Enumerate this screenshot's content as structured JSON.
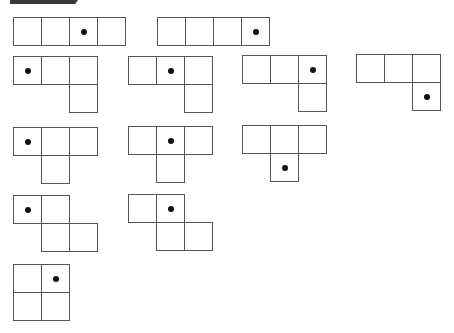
{
  "header": {
    "banner_color": "#3a3a3a"
  },
  "colors": {
    "grid_line": "#555555",
    "dot": "#111111",
    "background": "#ffffff"
  },
  "cell_size": 29,
  "shapes": [
    {
      "id": "I-dot-3",
      "x": 13,
      "y": 17,
      "cells": [
        [
          0,
          0
        ],
        [
          1,
          0
        ],
        [
          2,
          0
        ],
        [
          3,
          0
        ]
      ],
      "dot": [
        2,
        0
      ]
    },
    {
      "id": "I-dot-4",
      "x": 157,
      "y": 17,
      "cells": [
        [
          0,
          0
        ],
        [
          1,
          0
        ],
        [
          2,
          0
        ],
        [
          3,
          0
        ]
      ],
      "dot": [
        3,
        0
      ]
    },
    {
      "id": "L-dot-1",
      "x": 13,
      "y": 56,
      "cells": [
        [
          0,
          0
        ],
        [
          1,
          0
        ],
        [
          2,
          0
        ],
        [
          2,
          1
        ]
      ],
      "dot": [
        0,
        0
      ]
    },
    {
      "id": "L-dot-2",
      "x": 128,
      "y": 56,
      "cells": [
        [
          0,
          0
        ],
        [
          1,
          0
        ],
        [
          2,
          0
        ],
        [
          2,
          1
        ]
      ],
      "dot": [
        1,
        0
      ]
    },
    {
      "id": "L-dot-3",
      "x": 242,
      "y": 55,
      "cells": [
        [
          0,
          0
        ],
        [
          1,
          0
        ],
        [
          2,
          0
        ],
        [
          2,
          1
        ]
      ],
      "dot": [
        2,
        0
      ]
    },
    {
      "id": "L-dot-4",
      "x": 356,
      "y": 54,
      "cells": [
        [
          0,
          0
        ],
        [
          1,
          0
        ],
        [
          2,
          0
        ],
        [
          2,
          1
        ]
      ],
      "dot": [
        2,
        1
      ]
    },
    {
      "id": "T-dot-1",
      "x": 13,
      "y": 127,
      "cells": [
        [
          0,
          0
        ],
        [
          1,
          0
        ],
        [
          2,
          0
        ],
        [
          1,
          1
        ]
      ],
      "dot": [
        0,
        0
      ]
    },
    {
      "id": "T-dot-2",
      "x": 128,
      "y": 126,
      "cells": [
        [
          0,
          0
        ],
        [
          1,
          0
        ],
        [
          2,
          0
        ],
        [
          1,
          1
        ]
      ],
      "dot": [
        1,
        0
      ]
    },
    {
      "id": "T-dot-4",
      "x": 242,
      "y": 125,
      "cells": [
        [
          0,
          0
        ],
        [
          1,
          0
        ],
        [
          2,
          0
        ],
        [
          1,
          1
        ]
      ],
      "dot": [
        1,
        1
      ]
    },
    {
      "id": "S-dot-1",
      "x": 13,
      "y": 195,
      "cells": [
        [
          0,
          0
        ],
        [
          1,
          0
        ],
        [
          1,
          1
        ],
        [
          2,
          1
        ]
      ],
      "dot": [
        0,
        0
      ]
    },
    {
      "id": "S-dot-2",
      "x": 128,
      "y": 194,
      "cells": [
        [
          0,
          0
        ],
        [
          1,
          0
        ],
        [
          1,
          1
        ],
        [
          2,
          1
        ]
      ],
      "dot": [
        1,
        0
      ]
    },
    {
      "id": "O-dot-2",
      "x": 13,
      "y": 264,
      "cells": [
        [
          0,
          0
        ],
        [
          1,
          0
        ],
        [
          0,
          1
        ],
        [
          1,
          1
        ]
      ],
      "dot": [
        1,
        0
      ]
    }
  ]
}
